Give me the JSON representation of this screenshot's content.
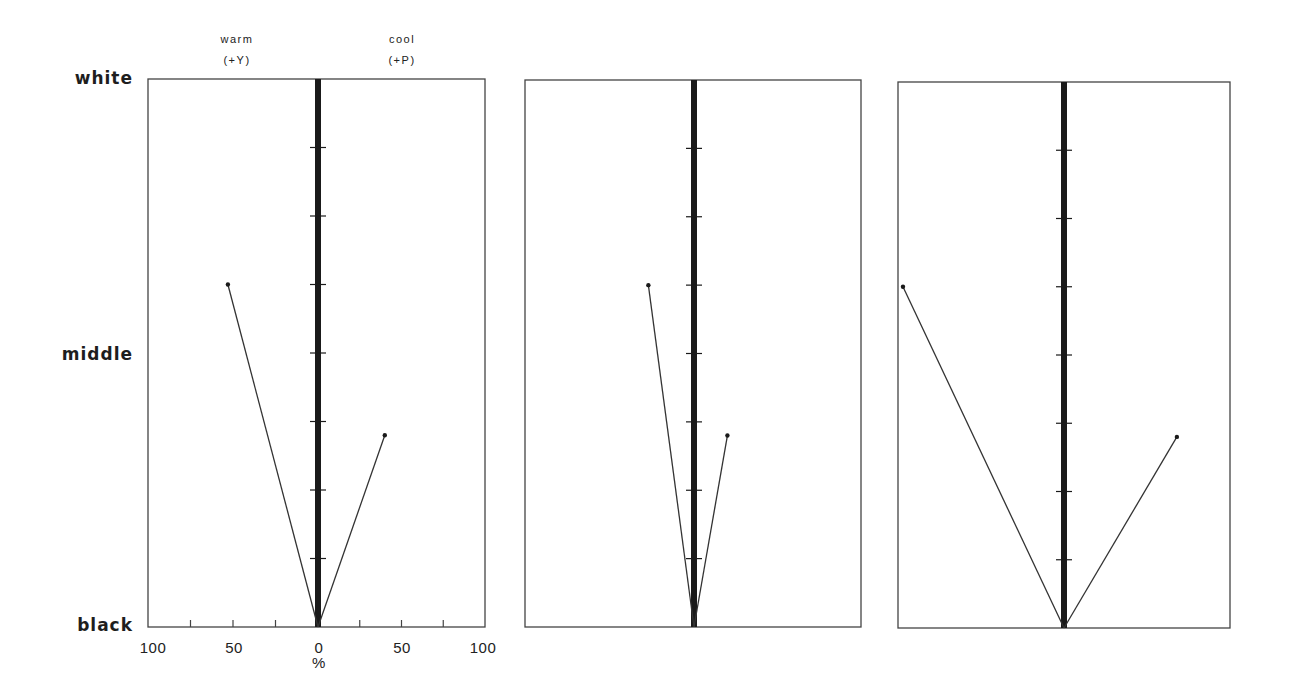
{
  "labels": {
    "warm": "warm",
    "warm_sub": "(+Y)",
    "cool": "cool",
    "cool_sub": "(+P)",
    "white": "white",
    "middle": "middle",
    "black": "black",
    "x_unit": "%",
    "x_ticks": [
      "100",
      "50",
      "0",
      "50",
      "100"
    ]
  },
  "colors": {
    "frame": "#444444",
    "axis": "#1a1a1a",
    "line": "#333333",
    "background": "#ffffff"
  },
  "chart_data": {
    "type": "line",
    "title": "",
    "xlabel": "%",
    "x_axis": {
      "left_label": "warm (+Y)",
      "right_label": "cool (+P)",
      "range": [
        -100,
        100
      ],
      "ticks": [
        -100,
        -75,
        -50,
        -25,
        0,
        25,
        50,
        75,
        100
      ],
      "tick_labels": [
        "100",
        "50",
        "0",
        "50",
        "100"
      ],
      "note": "negative = warm (+Y), positive = cool (+P)"
    },
    "y_axis": {
      "labels": [
        "black",
        "middle",
        "white"
      ],
      "range": [
        0,
        8
      ],
      "tick_count": 7,
      "note": "0 = black, 4 = middle, 8 = white"
    },
    "grid": false,
    "panels": [
      {
        "name": "panel-1",
        "show_x_ticks": true,
        "series": [
          {
            "name": "warm branch",
            "points": [
              {
                "x": 0,
                "y": 0
              },
              {
                "x": -53,
                "y": 5.0
              }
            ]
          },
          {
            "name": "cool branch",
            "points": [
              {
                "x": 0,
                "y": 0
              },
              {
                "x": 40,
                "y": 2.8
              }
            ]
          }
        ]
      },
      {
        "name": "panel-2",
        "show_x_ticks": false,
        "series": [
          {
            "name": "warm branch",
            "points": [
              {
                "x": 0,
                "y": 0
              },
              {
                "x": -27,
                "y": 5.0
              }
            ]
          },
          {
            "name": "cool branch",
            "points": [
              {
                "x": 0,
                "y": 0
              },
              {
                "x": 20,
                "y": 2.8
              }
            ]
          }
        ]
      },
      {
        "name": "panel-3",
        "show_x_ticks": false,
        "series": [
          {
            "name": "warm branch",
            "points": [
              {
                "x": 0,
                "y": 0
              },
              {
                "x": -97,
                "y": 5.0
              }
            ]
          },
          {
            "name": "cool branch",
            "points": [
              {
                "x": 0,
                "y": 0
              },
              {
                "x": 68,
                "y": 2.8
              }
            ]
          }
        ]
      }
    ]
  }
}
